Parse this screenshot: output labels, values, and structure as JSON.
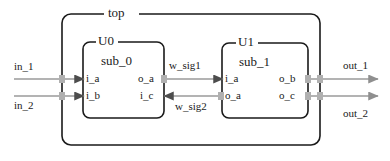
{
  "diagram": {
    "title": "top",
    "blocks": [
      {
        "id": "u0",
        "instance": "U0",
        "module": "sub_0",
        "ports": {
          "in_top": "i_a",
          "in_bottom": "i_b",
          "out_top": "o_a",
          "out_bottom": "i_c"
        }
      },
      {
        "id": "u1",
        "instance": "U1",
        "module": "sub_1",
        "ports": {
          "in_top": "i_a",
          "in_bottom": "o_a",
          "out_top": "o_b",
          "out_bottom": "o_c"
        }
      }
    ],
    "external_inputs": [
      {
        "name": "in_1"
      },
      {
        "name": "in_2"
      }
    ],
    "external_outputs": [
      {
        "name": "out_1"
      },
      {
        "name": "out_2"
      }
    ],
    "internal_signals": [
      {
        "name": "w_sig1",
        "direction": "left-to-right"
      },
      {
        "name": "w_sig2",
        "direction": "right-to-left"
      }
    ],
    "colors": {
      "border": "#1a1a1a",
      "text": "#1a1a1a",
      "wire": "#9a9a9a",
      "arrow_dark": "#4d4d4d",
      "connector": "#b0b0b0",
      "background": "#ffffff"
    }
  }
}
